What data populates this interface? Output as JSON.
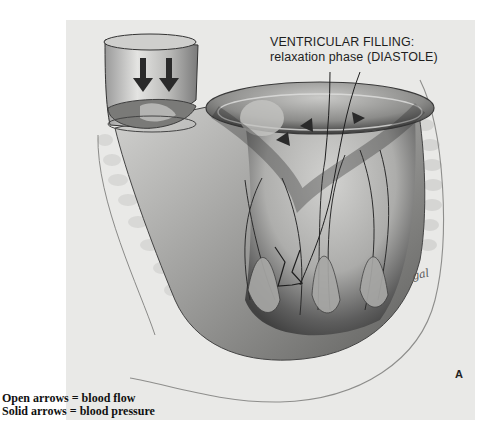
{
  "figure": {
    "title_line1": "VENTRICULAR FILLING:",
    "title_line2": "relaxation phase (DIASTOLE)",
    "panel_label": "A",
    "signature": "gal"
  },
  "legend": {
    "open_arrows": "Open arrows = blood flow",
    "solid_arrows": "Solid arrows = blood pressure"
  },
  "colors": {
    "panel_bg": "#e9e9e7",
    "ink": "#1e1e1e",
    "shade_dark": "#3a3a3a",
    "shade_mid": "#8a8a8a",
    "shade_light": "#c8c8c6"
  }
}
